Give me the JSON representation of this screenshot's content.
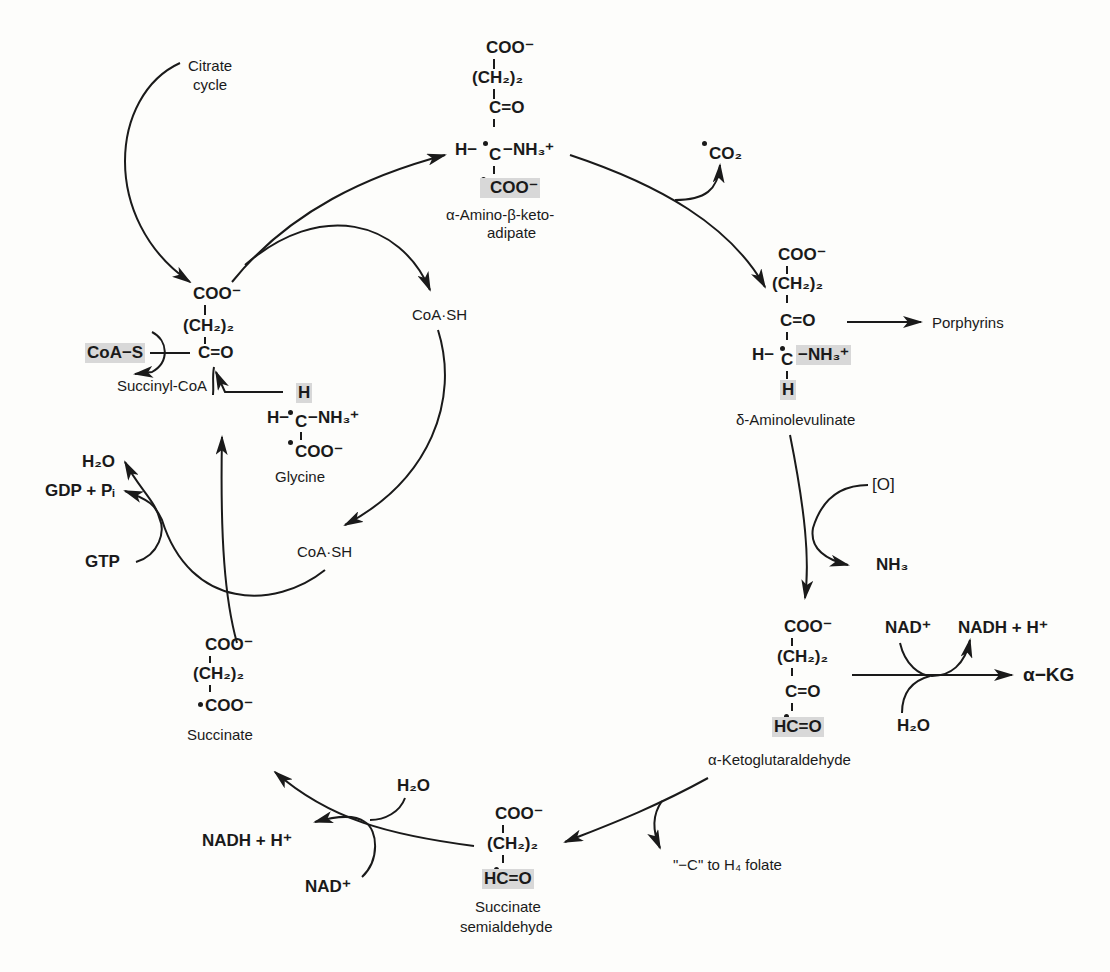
{
  "diagram": {
    "ink_color": "#1a1a1a",
    "highlight_color": "#d8d8d8",
    "background_color": "#fdfdfb"
  },
  "inputs": {
    "citrate_cycle": [
      "Citrate",
      "cycle"
    ]
  },
  "compounds": {
    "succinyl_coa": {
      "name": "Succinyl-CoA",
      "lines": [
        "COO⁻",
        "(CH₂)₂",
        "C=O"
      ],
      "substituent": "CoA−S"
    },
    "glycine": {
      "name": "Glycine",
      "top": "H",
      "middle_left": "H−",
      "middle_c": "C",
      "middle_right": "−NH₃⁺",
      "bottom": "COO⁻"
    },
    "amino_keto_adipate": {
      "name_line1": "α-Amino-β-keto-",
      "name_line2": "adipate",
      "lines": [
        "COO⁻",
        "(CH₂)₂",
        "C=O"
      ],
      "middle_left": "H−",
      "middle_c": "C",
      "middle_right": "−NH₃⁺",
      "bottom": "COO⁻"
    },
    "aminolevulinate": {
      "name": "δ-Aminolevulinate",
      "lines": [
        "COO⁻",
        "(CH₂)₂",
        "C=O"
      ],
      "middle_left": "H−",
      "middle_c": "C",
      "middle_right": "−NH₃⁺",
      "bottom": "H"
    },
    "ketoglutaraldehyde": {
      "name": "α-Ketoglutaraldehyde",
      "lines": [
        "COO⁻",
        "(CH₂)₂",
        "C=O"
      ],
      "bottom": "HC=O"
    },
    "succinate_semialdehyde": {
      "name_line1": "Succinate",
      "name_line2": "semialdehyde",
      "lines": [
        "COO⁻",
        "(CH₂)₂"
      ],
      "bottom": "HC=O"
    },
    "succinate": {
      "name": "Succinate",
      "lines": [
        "COO⁻",
        "(CH₂)₂",
        "COO⁻"
      ]
    }
  },
  "side_products": {
    "co2": "CO₂",
    "porphyrins": "Porphyrins",
    "oxygen": "[O]",
    "nh3": "NH₃",
    "nad_plus_right": "NAD⁺",
    "nadh_right": "NADH + H⁺",
    "h2o_right": "H₂O",
    "alpha_kg": "α−KG",
    "c_to_folate": "\"−C\" to H₄ folate",
    "h2o_bottom": "H₂O",
    "nadh_left": "NADH + H⁺",
    "nad_plus_left": "NAD⁺",
    "coash_top": "CoA·SH",
    "coash_bottom": "CoA·SH",
    "h2o_left": "H₂O",
    "gdp_pi": "GDP + Pᵢ",
    "gtp": "GTP"
  }
}
